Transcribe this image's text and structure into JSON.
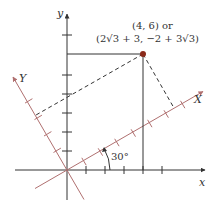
{
  "diagram": {
    "axes": {
      "x_label": "x",
      "y_label": "y",
      "rotated_x_label": "X",
      "rotated_y_label": "Y"
    },
    "angle_label": "30°",
    "point": {
      "xy": "(4, 6) or",
      "XY": "(2√3 + 3, −2 + 3√3)"
    },
    "colors": {
      "axis": "#333333",
      "rotated_axis": "#b07070",
      "point": "#8b2a1a"
    }
  }
}
